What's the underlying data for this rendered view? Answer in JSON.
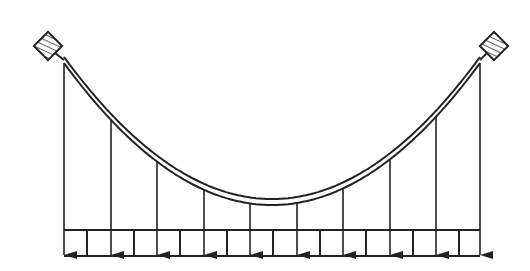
{
  "diagram": {
    "type": "suspension-cable-with-uniform-load",
    "colors": {
      "stroke": "#222222",
      "background": "#ffffff"
    },
    "anchors": [
      {
        "name": "left-anchor",
        "cx": 48,
        "cy": 46
      },
      {
        "name": "right-anchor",
        "cx": 494,
        "cy": 46
      }
    ],
    "cable": {
      "start": [
        64,
        60
      ],
      "lowest": [
        272,
        202
      ],
      "end": [
        480,
        60
      ],
      "thickness": 6
    },
    "hangers_x": [
      64,
      111,
      157,
      204,
      250,
      297,
      343,
      390,
      436,
      480
    ],
    "deck": {
      "x0": 64,
      "x1": 480,
      "y0": 230,
      "y1": 256,
      "dividers_x": [
        87,
        134,
        180,
        227,
        273,
        320,
        366,
        413,
        459
      ]
    }
  }
}
